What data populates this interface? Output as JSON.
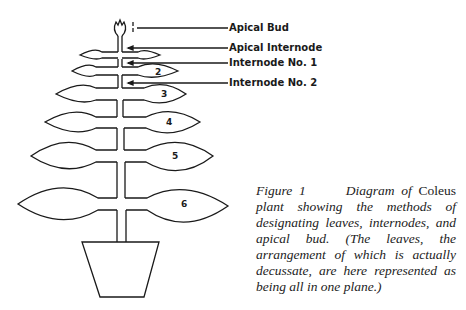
{
  "labels": {
    "apical_bud": "Apical Bud",
    "apical_internode": "Apical Internode",
    "internode_1": "Internode No. 1",
    "internode_2": "Internode No. 2"
  },
  "leaf_numbers": [
    "2",
    "3",
    "4",
    "5",
    "6"
  ],
  "caption": {
    "figure": "Figure 1",
    "part1": "Diagram of",
    "genus": "Coleus",
    "part2": "plant showing the methods of designating leaves, internodes, and apical bud. (The leaves, the arrangement of which is actually decussate, are here represented as being all in one plane.)"
  },
  "colors": {
    "line": "#1a1a1a",
    "background": "#ffffff"
  }
}
